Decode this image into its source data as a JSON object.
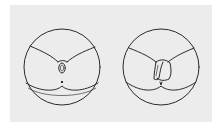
{
  "figure": {
    "panels": [
      {
        "id": "left",
        "label": "View 1"
      },
      {
        "id": "right",
        "label": "View 2"
      }
    ],
    "colors": {
      "background": "#ffffff",
      "panel": "#ececec",
      "line": "#2a2a2a"
    }
  }
}
